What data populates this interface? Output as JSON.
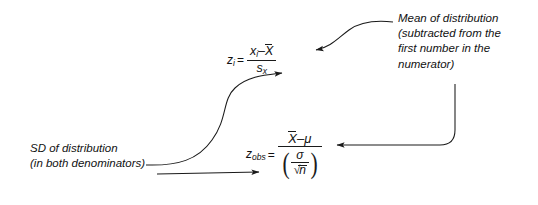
{
  "figure": {
    "type": "annotated-formula-diagram",
    "background_color": "#ffffff",
    "ink_color": "#1a1a1a"
  },
  "annotations": {
    "mean": {
      "name": "mean-of-distribution-label",
      "lines": [
        "Mean of distribution",
        "(subtracted from the",
        "first number in the",
        "numerator)"
      ]
    },
    "sd": {
      "name": "sd-of-distribution-label",
      "lines": [
        "SD of distribution",
        "(in both denominators)"
      ]
    }
  },
  "formulas": {
    "z_i": {
      "name": "z-score-individual",
      "lhs": "z",
      "lhs_sub": "i",
      "equals": "=",
      "numerator": "x",
      "numerator_sub": "i",
      "numerator_minus": "–",
      "numerator_mean": "X",
      "denominator": "s",
      "denominator_sub": "x",
      "plain": "z_i = (x_i - X̄) / s_x"
    },
    "z_obs": {
      "name": "z-score-observed",
      "lhs": "z",
      "lhs_sub": "obs",
      "equals": "=",
      "numerator_mean": "X",
      "numerator_minus": "–",
      "numerator_mu": "μ",
      "denominator_sigma": "σ",
      "denominator_radical_sym": "√",
      "denominator_radicand": "n",
      "paren_left": "(",
      "paren_right": ")",
      "plain": "z_obs = (X̄ - μ) / (σ / √n)"
    }
  },
  "connectors": [
    {
      "name": "mean-to-zi-connector",
      "from": "mean-of-distribution-label",
      "to": "z_i numerator X̄",
      "style": "curved-arrow"
    },
    {
      "name": "mean-to-zobs-connector",
      "from": "mean-of-distribution-label",
      "to": "z_obs numerator X̄",
      "style": "elbow-arrow"
    },
    {
      "name": "sd-to-zi-connector",
      "from": "sd-of-distribution-label",
      "to": "z_i denominator s_x",
      "style": "s-curve-arrow"
    },
    {
      "name": "sd-to-zobs-connector",
      "from": "sd-of-distribution-label",
      "to": "z_obs denominator",
      "style": "straight-arrow"
    }
  ]
}
